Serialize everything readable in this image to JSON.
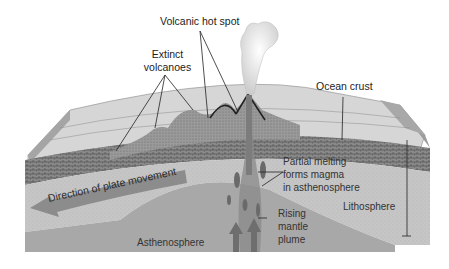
{
  "diagram": {
    "labels": {
      "volcanic_hot_spot": "Volcanic hot spot",
      "extinct_volcanoes_line1": "Extinct",
      "extinct_volcanoes_line2": "volcanoes",
      "ocean_crust": "Ocean crust",
      "direction_of_plate_movement": "Direction of plate movement",
      "partial_melting_line1": "Partial melting",
      "partial_melting_line2": "forms magma",
      "partial_melting_line3": "in asthenosphere",
      "lithosphere": "Lithosphere",
      "rising_plume_line1": "Rising",
      "rising_plume_line2": "mantle",
      "rising_plume_line3": "plume",
      "asthenosphere": "Asthenosphere"
    },
    "colors": {
      "background": "#ffffff",
      "ocean_surface": "#d4d4d4",
      "ocean_side": "#a8a8a8",
      "crust_texture": "#6e6e6e",
      "lithosphere": "#c8c8c8",
      "asthenosphere": "#a9a9a9",
      "plume": "#7a7a7a",
      "arrow": "#8c8c8c",
      "leader_lines": "#222222"
    }
  }
}
